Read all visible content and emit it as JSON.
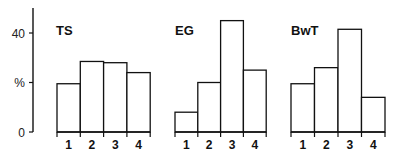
{
  "chart_data": [
    {
      "type": "bar",
      "title": "TS",
      "categories": [
        "1",
        "2",
        "3",
        "4"
      ],
      "values": [
        19.5,
        28.5,
        28,
        24
      ],
      "xlabel": "",
      "ylabel": "%",
      "ylim": [
        0,
        50
      ]
    },
    {
      "type": "bar",
      "title": "EG",
      "categories": [
        "1",
        "2",
        "3",
        "4"
      ],
      "values": [
        8,
        20,
        45,
        25
      ],
      "xlabel": "",
      "ylabel": "%",
      "ylim": [
        0,
        50
      ]
    },
    {
      "type": "bar",
      "title": "BwT",
      "categories": [
        "1",
        "2",
        "3",
        "4"
      ],
      "values": [
        19.5,
        26,
        41.5,
        14
      ],
      "xlabel": "",
      "ylabel": "%",
      "ylim": [
        0,
        50
      ]
    }
  ],
  "axis": {
    "y_ticks": [
      {
        "value": 0,
        "label": "0"
      },
      {
        "value": 20,
        "label": "%"
      },
      {
        "value": 40,
        "label": "40"
      }
    ]
  },
  "style": {
    "bar_fill": "#ffffff",
    "stroke": "#111111"
  }
}
